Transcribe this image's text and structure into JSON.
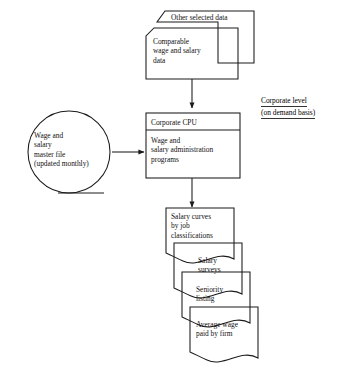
{
  "diagram": {
    "background": "#ffffff",
    "line_color": "#1a1a1a"
  },
  "annotation": {
    "line1": "Corporate level",
    "line2": "(on demand basis)"
  },
  "inputs": [
    {
      "id": "other-selected-data",
      "text": "Other selected data",
      "shape": "punched-card"
    },
    {
      "id": "comparable-wage-salary-data",
      "text": "Comparable\nwage and salary\ndata",
      "shape": "punched-card"
    }
  ],
  "storage": {
    "id": "wage-salary-master-file",
    "shape": "magnetic-tape",
    "text": "Wage and\nsalary\nmaster file\n(updated monthly)"
  },
  "process": {
    "id": "corporate-cpu",
    "shape": "process-box",
    "header": "Corporate CPU",
    "body": "Wage and\nsalary administration\nprograms"
  },
  "outputs": [
    {
      "id": "salary-curves",
      "text": "Salary curves\nby job\nclassifications",
      "shape": "document"
    },
    {
      "id": "salary-surveys",
      "text": "Salary\nsurveys",
      "shape": "document"
    },
    {
      "id": "seniority-listing",
      "text": "Seniority\nlisting",
      "shape": "document"
    },
    {
      "id": "average-wage-paid",
      "text": "Average wage\npaid by firm",
      "shape": "document"
    }
  ],
  "connectors": [
    {
      "id": "inputs-to-cpu",
      "from": "comparable-wage-salary-data",
      "to": "corporate-cpu",
      "direction": "down"
    },
    {
      "id": "masterfile-to-cpu",
      "from": "wage-salary-master-file",
      "to": "corporate-cpu",
      "direction": "right"
    },
    {
      "id": "cpu-to-outputs",
      "from": "corporate-cpu",
      "to": "salary-curves",
      "direction": "down"
    }
  ]
}
